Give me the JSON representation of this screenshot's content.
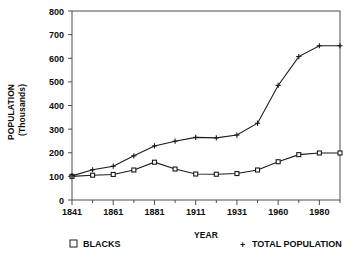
{
  "chart_data": {
    "type": "line",
    "title": "",
    "xlabel": "YEAR",
    "ylabel": "POPULATION (Thousands)",
    "ylabel_line1": "POPULATION",
    "ylabel_line2": "(Thousands)",
    "ylim": [
      0,
      800
    ],
    "ytick_labels": [
      "0",
      "100",
      "200",
      "300",
      "400",
      "500",
      "600",
      "700",
      "800"
    ],
    "ytick_values": [
      0,
      100,
      200,
      300,
      400,
      500,
      600,
      700,
      800
    ],
    "grid": false,
    "legend_position": "below-axes",
    "x": [
      1841,
      1851,
      1861,
      1871,
      1881,
      1891,
      1911,
      1921,
      1931,
      1941,
      1960,
      1971,
      1980,
      1991
    ],
    "xtick_labels": [
      "1841",
      "",
      "1861",
      "",
      "1881",
      "",
      "1911",
      "",
      "1931",
      "",
      "1960",
      "",
      "1980",
      ""
    ],
    "xtick_major": [
      "1841",
      "1861",
      "1881",
      "1911",
      "1931",
      "1960",
      "1980"
    ],
    "series": [
      {
        "name": "BLACKS",
        "marker": "square",
        "legend_symbol": "□",
        "values": [
          100,
          105,
          108,
          127,
          160,
          131,
          110,
          109,
          112,
          127,
          162,
          192,
          199,
          199
        ]
      },
      {
        "name": "TOTAL POPULATION",
        "marker": "plus",
        "legend_symbol": "+",
        "values": [
          102,
          128,
          143,
          187,
          229,
          249,
          265,
          263,
          275,
          325,
          485,
          607,
          653,
          653
        ]
      }
    ]
  },
  "legend": {
    "left_symbol": "□",
    "left_label": "BLACKS",
    "right_symbol": "+",
    "right_label": "TOTAL POPULATION"
  },
  "colors": {
    "line": "#1a1a1a",
    "axis": "#4d4d4d",
    "text": "#0d0d0d",
    "background": "#ffffff"
  }
}
